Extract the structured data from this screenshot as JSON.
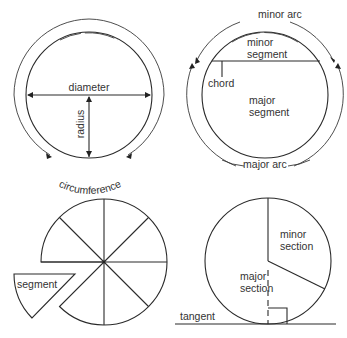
{
  "figures": {
    "circle_parts": {
      "labels": {
        "diameter": "diameter",
        "radius": "radius",
        "circumference": "circumference"
      }
    },
    "arcs_and_segments": {
      "labels": {
        "minor_arc": "minor arc",
        "minor_segment_line1": "minor",
        "minor_segment_line2": "segment",
        "chord": "chord",
        "major_segment_line1": "major",
        "major_segment_line2": "segment",
        "major_arc": "major arc"
      }
    },
    "sectors": {
      "labels": {
        "segment": "segment"
      },
      "sector_count": 8
    },
    "sections_tangent": {
      "labels": {
        "minor_section_line1": "minor",
        "minor_section_line2": "section",
        "major_section_line1": "major",
        "major_section_line2": "section",
        "tangent": "tangent"
      }
    }
  },
  "colors": {
    "line": "#2a2a2a",
    "text": "#333333",
    "background": "#ffffff"
  }
}
